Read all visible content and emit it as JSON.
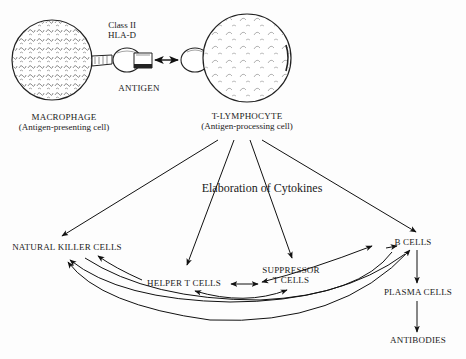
{
  "diagram": {
    "cells": {
      "macrophage": {
        "name": "MACROPHAGE",
        "role": "(Antigen-presenting cell)"
      },
      "t_lymphocyte": {
        "name": "T-LYMPHOCYTE",
        "role": "(Antigen-processing cell)"
      }
    },
    "labels": {
      "class_ii_line1": "Class II",
      "class_ii_line2": "HLA-D",
      "antigen": "ANTIGEN",
      "cytokines": "Elaboration of Cytokines",
      "natural_killer": "NATURAL KILLER CELLS",
      "helper_t": "HELPER T CELLS",
      "suppressor_line1": "SUPPRESSOR",
      "suppressor_line2": "T CELLS",
      "b_cells": "B CELLS",
      "plasma_cells": "PLASMA CELLS",
      "antibodies": "ANTIBODIES"
    },
    "edges": [
      {
        "from": "T-LYMPHOCYTE",
        "to": "NATURAL KILLER CELLS"
      },
      {
        "from": "T-LYMPHOCYTE",
        "to": "HELPER T CELLS"
      },
      {
        "from": "T-LYMPHOCYTE",
        "to": "SUPPRESSOR T CELLS"
      },
      {
        "from": "T-LYMPHOCYTE",
        "to": "B CELLS"
      },
      {
        "from": "HELPER T CELLS",
        "to": "NATURAL KILLER CELLS"
      },
      {
        "from": "SUPPRESSOR T CELLS",
        "to": "NATURAL KILLER CELLS"
      },
      {
        "from": "B CELLS",
        "to": "NATURAL KILLER CELLS"
      },
      {
        "from": "HELPER T CELLS",
        "to": "SUPPRESSOR T CELLS",
        "bidirectional": true
      },
      {
        "from": "SUPPRESSOR T CELLS",
        "to": "B CELLS",
        "bidirectional": true
      },
      {
        "from": "HELPER T CELLS",
        "to": "B CELLS",
        "bidirectional": true
      },
      {
        "from": "B CELLS",
        "to": "PLASMA CELLS"
      },
      {
        "from": "PLASMA CELLS",
        "to": "ANTIBODIES"
      },
      {
        "from": "MACROPHAGE",
        "to": "T-LYMPHOCYTE",
        "bidirectional": true,
        "via": "ANTIGEN"
      }
    ]
  }
}
